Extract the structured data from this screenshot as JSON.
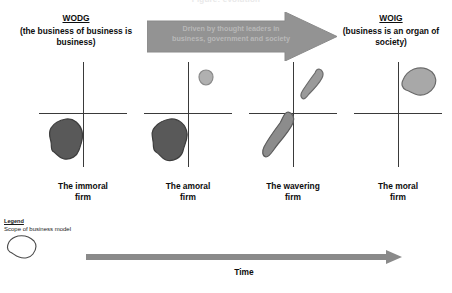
{
  "title_clipped": "Figure: evolution",
  "poles": {
    "left": {
      "code": "WODG",
      "expansion": "(the business of business is business)"
    },
    "right": {
      "code": "WOIG",
      "expansion": "(business is an organ of society)"
    }
  },
  "driver_arrow": {
    "line1": "Driven by thought leaders in",
    "line2": "business, government and society",
    "color": "#939393",
    "text_color": "#b8b8b8"
  },
  "stages": [
    {
      "caption_line1": "The immoral",
      "caption_line2": "firm",
      "blobs": [
        {
          "quadrant": "lower-left",
          "shade": "dark",
          "color": "#595959"
        }
      ]
    },
    {
      "caption_line1": "The amoral",
      "caption_line2": "firm",
      "blobs": [
        {
          "quadrant": "lower-left",
          "shade": "dark",
          "color": "#595959"
        },
        {
          "quadrant": "upper-right",
          "shade": "light",
          "color": "#b0b0b0"
        }
      ]
    },
    {
      "caption_line1": "The wavering",
      "caption_line2": "firm",
      "blobs": [
        {
          "quadrant": "lower-left",
          "shade": "mid",
          "color": "#8c8c8c"
        },
        {
          "quadrant": "upper-right",
          "shade": "mid",
          "color": "#9a9a9a"
        }
      ]
    },
    {
      "caption_line1": "The moral",
      "caption_line2": "firm",
      "blobs": [
        {
          "quadrant": "upper-right",
          "shade": "light",
          "color": "#a8a8a8"
        }
      ]
    }
  ],
  "legend": {
    "title": "Legend",
    "description": "Scope of business model"
  },
  "time_axis": {
    "label": "Time",
    "color": "#8a8a8a"
  },
  "colors": {
    "axis": "#3a3a3a",
    "text": "#0d0d0d",
    "arrow_gray": "#939393"
  }
}
